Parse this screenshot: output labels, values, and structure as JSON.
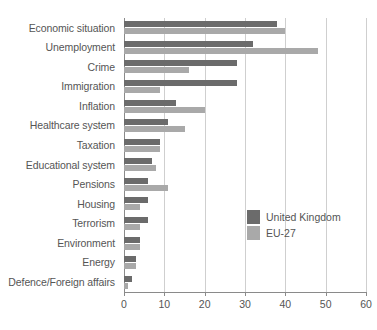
{
  "chart_data": {
    "type": "bar",
    "orientation": "horizontal",
    "title": "",
    "subtitle": "",
    "xlabel": "",
    "ylabel": "",
    "xlim": [
      0,
      60
    ],
    "xticks": [
      0,
      10,
      20,
      30,
      40,
      50,
      60
    ],
    "xtick_labels": [
      "0",
      "10",
      "20",
      "30",
      "40",
      "50",
      "60"
    ],
    "grid": "vertical",
    "legend_position": "middle-right",
    "categories": [
      "Economic situation",
      "Unemployment",
      "Crime",
      "Immigration",
      "Inflation",
      "Healthcare system",
      "Taxation",
      "Educational system",
      "Pensions",
      "Housing",
      "Terrorism",
      "Environment",
      "Energy",
      "Defence/Foreign affairs"
    ],
    "series": [
      {
        "name": "United Kingdom",
        "color": "#6b6b6b",
        "values": [
          38,
          32,
          28,
          28,
          13,
          11,
          9,
          7,
          6,
          6,
          6,
          4,
          3,
          2
        ]
      },
      {
        "name": "EU-27",
        "color": "#a9a9a9",
        "values": [
          40,
          48,
          16,
          9,
          20,
          15,
          9,
          8,
          11,
          4,
          4,
          4,
          3,
          1
        ]
      }
    ]
  },
  "legend": {
    "items": [
      {
        "label": "United Kingdom",
        "color": "#6b6b6b"
      },
      {
        "label": "EU-27",
        "color": "#a9a9a9"
      }
    ]
  },
  "colors": {
    "uk_bar": "#6b6b6b",
    "eu_bar": "#a9a9a9",
    "gridline": "#cfcfcf",
    "axis": "#8a8a8a",
    "text": "#555555",
    "background": "#ffffff"
  }
}
